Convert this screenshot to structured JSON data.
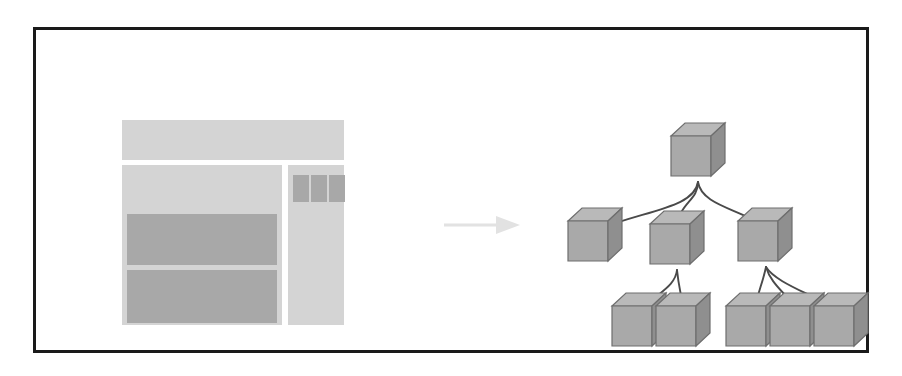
{
  "figure": {
    "background_color": "#ffffff",
    "frame": {
      "name": "figure-border",
      "border_color": "#1a1a1a",
      "border_width_px": 3
    }
  },
  "wireframe": {
    "label": "webpage-wireframe",
    "colors": {
      "light": "#d4d4d4",
      "mid": "#c9c9c9",
      "dark": "#a8a8a8"
    },
    "blocks": [
      {
        "id": "header",
        "role": "page-header-banner",
        "shade": "light"
      },
      {
        "id": "main-column",
        "role": "main-content-column",
        "shade": "light"
      },
      {
        "id": "main-hero",
        "role": "hero-region",
        "shade": "light"
      },
      {
        "id": "main-bar-1",
        "role": "content-block-primary",
        "shade": "dark"
      },
      {
        "id": "main-bar-2",
        "role": "content-block-secondary",
        "shade": "dark"
      },
      {
        "id": "side-column",
        "role": "sidebar-column",
        "shade": "light"
      },
      {
        "id": "side-tile-1",
        "role": "sidebar-tile",
        "shade": "dark"
      },
      {
        "id": "side-tile-2",
        "role": "sidebar-tile",
        "shade": "dark"
      },
      {
        "id": "side-tile-3",
        "role": "sidebar-tile",
        "shade": "dark"
      }
    ]
  },
  "arrow": {
    "name": "transform-arrow",
    "direction": "right",
    "color": "#e2e2e2"
  },
  "tree": {
    "label": "hierarchical-block-tree",
    "cube_colors": {
      "top_face": "#b9b9b9",
      "front_face": "#a9a9a9",
      "side_face": "#8f8f8f",
      "outline": "#6e6e6e"
    },
    "edge_color": "#4a4a4a",
    "levels": 3,
    "node_count": 9,
    "nodes": [
      {
        "id": "n0",
        "level": 0,
        "parent": null,
        "x": 141,
        "y": 30,
        "children": 3
      },
      {
        "id": "n1",
        "level": 1,
        "parent": "n0",
        "x": 38,
        "y": 115,
        "children": 0
      },
      {
        "id": "n2",
        "level": 1,
        "parent": "n0",
        "x": 120,
        "y": 118,
        "children": 2
      },
      {
        "id": "n3",
        "level": 1,
        "parent": "n0",
        "x": 208,
        "y": 115,
        "children": 3
      },
      {
        "id": "n4",
        "level": 2,
        "parent": "n2",
        "x": 82,
        "y": 200,
        "children": 0
      },
      {
        "id": "n5",
        "level": 2,
        "parent": "n2",
        "x": 126,
        "y": 200,
        "children": 0
      },
      {
        "id": "n6",
        "level": 2,
        "parent": "n3",
        "x": 196,
        "y": 200,
        "children": 0
      },
      {
        "id": "n7",
        "level": 2,
        "parent": "n3",
        "x": 240,
        "y": 200,
        "children": 0
      },
      {
        "id": "n8",
        "level": 2,
        "parent": "n3",
        "x": 284,
        "y": 200,
        "children": 0
      }
    ],
    "edges": [
      {
        "from": "n0",
        "to": "n1"
      },
      {
        "from": "n0",
        "to": "n2"
      },
      {
        "from": "n0",
        "to": "n3"
      },
      {
        "from": "n2",
        "to": "n4"
      },
      {
        "from": "n2",
        "to": "n5"
      },
      {
        "from": "n3",
        "to": "n6"
      },
      {
        "from": "n3",
        "to": "n7"
      },
      {
        "from": "n3",
        "to": "n8"
      }
    ]
  }
}
